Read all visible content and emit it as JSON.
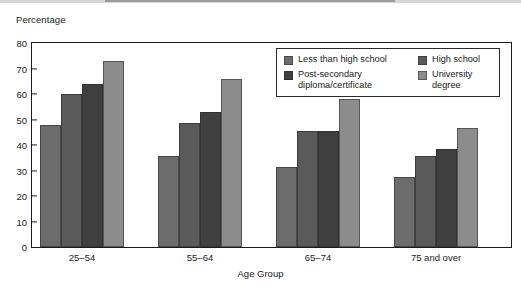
{
  "chart_data": {
    "type": "bar",
    "title": "",
    "xlabel": "Age Group",
    "ylabel": "Percentage",
    "ylim": [
      0,
      80
    ],
    "yticks": [
      0,
      10,
      20,
      30,
      40,
      50,
      60,
      70,
      80
    ],
    "ytick_labels": [
      "0",
      "10",
      "20",
      "30",
      "40",
      "50",
      "60",
      "70",
      "80"
    ],
    "grid": false,
    "legend_position": "upper right inside plot",
    "categories": [
      "25–54",
      "55–64",
      "65–74",
      "75 and over",
      "65 and over"
    ],
    "series": [
      {
        "name": "Less than high school",
        "color": "#6c6c6c",
        "values": [
          48,
          35.5,
          31.5,
          27.5,
          30
        ]
      },
      {
        "name": "High school",
        "color": "#5a5a5a",
        "values": [
          60,
          48.5,
          45.5,
          35.5,
          41.5
        ]
      },
      {
        "name": "Post-secondary\ndiploma/certificate",
        "color": "#3f3f3f",
        "values": [
          64,
          53,
          45.5,
          38.5,
          43.5
        ]
      },
      {
        "name": "University degree",
        "color": "#8c8c8c",
        "values": [
          73,
          66,
          58,
          46.5,
          55
        ]
      }
    ],
    "legend_order": [
      "Less than high school",
      "High school",
      "Post-secondary\ndiploma/certificate",
      "University degree"
    ],
    "group_gap_note": "a wide empty gap separates '75 and over' from '65 and over'"
  }
}
